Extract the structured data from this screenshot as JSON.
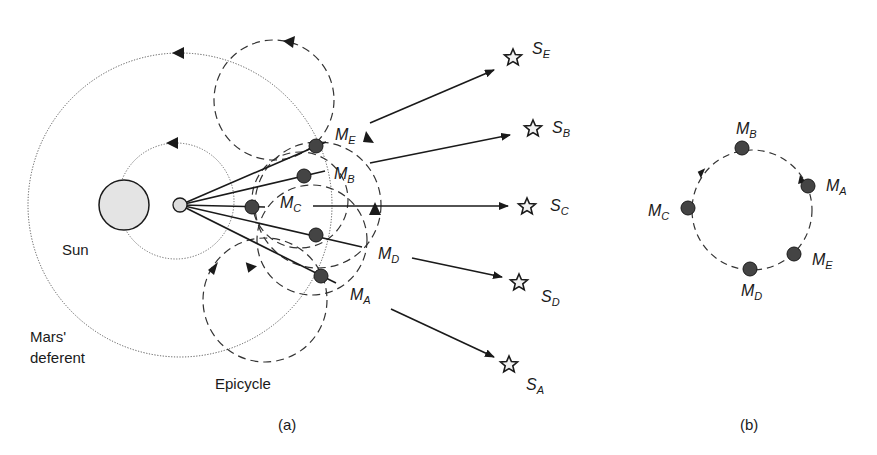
{
  "panel_a": {
    "caption": "(a)",
    "labels": {
      "sun": "Sun",
      "deferent_line1": "Mars'",
      "deferent_line2": "deferent",
      "epicycle": "Epicycle"
    },
    "sun": {
      "x": 124,
      "y": 205,
      "r": 25,
      "fill": "#e4e4e4"
    },
    "earth": {
      "x": 180,
      "y": 205,
      "r": 7,
      "fill": "#dddddd"
    },
    "mars_positions": [
      {
        "id": "M_E",
        "main": "M",
        "sub": "E",
        "x": 316,
        "y": 146
      },
      {
        "id": "M_B",
        "main": "M",
        "sub": "B",
        "x": 304,
        "y": 176
      },
      {
        "id": "M_C",
        "main": "M",
        "sub": "C",
        "x": 252,
        "y": 207
      },
      {
        "id": "M_D",
        "main": "M",
        "sub": "D",
        "x": 316,
        "y": 235
      },
      {
        "id": "M_A",
        "main": "M",
        "sub": "A",
        "x": 321,
        "y": 276
      }
    ],
    "star_positions": [
      {
        "id": "S_E",
        "main": "S",
        "sub": "E",
        "x": 513,
        "y": 57
      },
      {
        "id": "S_B",
        "main": "S",
        "sub": "B",
        "x": 533,
        "y": 128
      },
      {
        "id": "S_C",
        "main": "S",
        "sub": "C",
        "x": 527,
        "y": 206
      },
      {
        "id": "S_D",
        "main": "S",
        "sub": "D",
        "x": 519,
        "y": 282
      },
      {
        "id": "S_A",
        "main": "S",
        "sub": "A",
        "x": 509,
        "y": 364
      }
    ]
  },
  "panel_b": {
    "caption": "(b)",
    "circle": {
      "cx": 752,
      "cy": 240,
      "r": 60
    },
    "positions": [
      {
        "id": "M_B",
        "main": "M",
        "sub": "B",
        "x": 742,
        "y": 148
      },
      {
        "id": "M_A",
        "main": "M",
        "sub": "A",
        "x": 808,
        "y": 186
      },
      {
        "id": "M_C",
        "main": "M",
        "sub": "C",
        "x": 688,
        "y": 208
      },
      {
        "id": "M_E",
        "main": "M",
        "sub": "E",
        "x": 794,
        "y": 254
      },
      {
        "id": "M_D",
        "main": "M",
        "sub": "D",
        "x": 750,
        "y": 269
      }
    ]
  },
  "colors": {
    "ink": "#1a1a1a",
    "planet_fill": "#444444",
    "dotted": "#555555"
  }
}
